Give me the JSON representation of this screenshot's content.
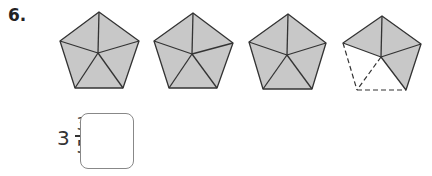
{
  "question": {
    "number": "6.",
    "whole": "3",
    "numerator": "3",
    "denominator": "5",
    "equals": "=",
    "answer_value": ""
  },
  "figure": {
    "fill_color": "#c8c8c8",
    "stroke_color": "#333333",
    "pentagons": [
      {
        "shaded_parts": 5,
        "total_parts": 5
      },
      {
        "shaded_parts": 5,
        "total_parts": 5
      },
      {
        "shaded_parts": 5,
        "total_parts": 5
      },
      {
        "shaded_parts": 3,
        "total_parts": 5
      }
    ]
  }
}
